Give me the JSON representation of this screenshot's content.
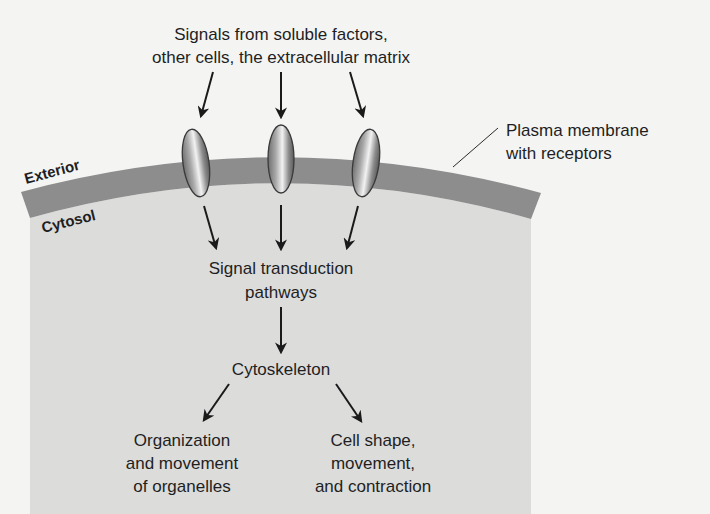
{
  "diagram": {
    "colors": {
      "background": "#f4f4f3",
      "cytosol": "#dcdcdb",
      "membrane": "#8d8d8d",
      "receptor_edge": "#3a3a3a",
      "arrow": "#1a1a1a",
      "text": "#1f1f1f"
    },
    "labels": {
      "signals_line1": "Signals from soluble factors,",
      "signals_line2": "other cells, the extracellular matrix",
      "membrane_line1": "Plasma membrane",
      "membrane_line2": "with receptors",
      "exterior": "Exterior",
      "cytosol": "Cytosol",
      "transduction_line1": "Signal transduction",
      "transduction_line2": "pathways",
      "cytoskeleton": "Cytoskeleton",
      "organelles_line1": "Organization",
      "organelles_line2": "and movement",
      "organelles_line3": "of organelles",
      "cellshape_line1": "Cell shape,",
      "cellshape_line2": "movement,",
      "cellshape_line3": "and contraction"
    },
    "receptors": [
      {
        "name": "receptor-left",
        "cx": 196,
        "cy": 163,
        "rotate": -8
      },
      {
        "name": "receptor-middle",
        "cx": 281,
        "cy": 159,
        "rotate": 0
      },
      {
        "name": "receptor-right",
        "cx": 366,
        "cy": 163,
        "rotate": 8
      }
    ]
  }
}
